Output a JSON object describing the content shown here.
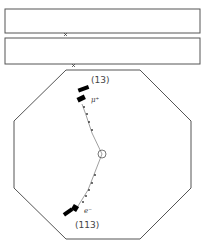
{
  "diagram": {
    "type": "particle-event-display",
    "colors": {
      "outline": "#555555",
      "track": "#777777",
      "hit": "#333333",
      "calo": "#000000"
    },
    "tracks": [
      {
        "particle": "μ⁺",
        "particle_label": "μ+",
        "id_label": "(13)"
      },
      {
        "particle": "e⁻",
        "particle_label": "e-",
        "id_label": "(113)"
      }
    ],
    "markers": {
      "vertex": "vertex-circle",
      "hits": "cross"
    }
  }
}
